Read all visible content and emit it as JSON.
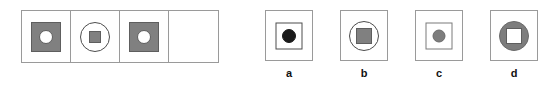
{
  "figure": {
    "type": "visual-analogy-matrix",
    "matrix": {
      "rows": 1,
      "columns": 4,
      "cells": [
        {
          "index": 1,
          "empty": false,
          "description": "gray filled square containing a white circle",
          "shapes": [
            {
              "form": "square",
              "fill": "#808080",
              "stroke": "#5e5e5e",
              "size": "large"
            },
            {
              "form": "circle",
              "fill": "#ffffff",
              "stroke": "#5e5e5e",
              "size": "small"
            }
          ]
        },
        {
          "index": 2,
          "empty": false,
          "description": "white outlined circle containing a small gray square",
          "shapes": [
            {
              "form": "circle",
              "fill": "none",
              "stroke": "#4d4d4d",
              "size": "large"
            },
            {
              "form": "square",
              "fill": "#808080",
              "stroke": "#5e5e5e",
              "size": "x-small"
            }
          ]
        },
        {
          "index": 3,
          "empty": false,
          "description": "gray filled square containing a white circle",
          "shapes": [
            {
              "form": "square",
              "fill": "#808080",
              "stroke": "#5e5e5e",
              "size": "large"
            },
            {
              "form": "circle",
              "fill": "#ffffff",
              "stroke": "#5e5e5e",
              "size": "small"
            }
          ]
        },
        {
          "index": 4,
          "empty": true,
          "description": "blank answer cell",
          "shapes": []
        }
      ]
    },
    "options": [
      {
        "label": "a",
        "description": "outlined square containing a black filled circle",
        "shapes": [
          {
            "form": "square",
            "fill": "none",
            "stroke": "#4d4d4d",
            "size": "large"
          },
          {
            "form": "circle",
            "fill": "#1a1a1a",
            "stroke": "#1a1a1a",
            "size": "small"
          }
        ]
      },
      {
        "label": "b",
        "description": "outlined circle containing a gray filled square",
        "shapes": [
          {
            "form": "circle",
            "fill": "none",
            "stroke": "#4d4d4d",
            "size": "large"
          },
          {
            "form": "square",
            "fill": "#808080",
            "stroke": "#5e5e5e",
            "size": "small"
          }
        ]
      },
      {
        "label": "c",
        "description": "outlined square containing a gray filled circle",
        "shapes": [
          {
            "form": "square",
            "fill": "none",
            "stroke": "#7a7a7a",
            "size": "large"
          },
          {
            "form": "circle",
            "fill": "#808080",
            "stroke": "#6a6a6a",
            "size": "small"
          }
        ]
      },
      {
        "label": "d",
        "description": "gray filled circle containing a white square",
        "shapes": [
          {
            "form": "circle",
            "fill": "#808080",
            "stroke": "#6a6a6a",
            "size": "large"
          },
          {
            "form": "square",
            "fill": "#ffffff",
            "stroke": "#5e5e5e",
            "size": "small"
          }
        ]
      }
    ],
    "colors": {
      "gray_fill": "#808080",
      "black_fill": "#1a1a1a",
      "white_fill": "#ffffff",
      "cell_border": "#9a9a9a",
      "shape_stroke": "#4d4d4d",
      "background": "#ffffff",
      "label_text": "#111111"
    }
  }
}
